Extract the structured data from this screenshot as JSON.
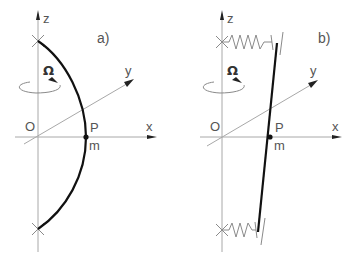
{
  "figure": {
    "panel_a": {
      "label": "a)",
      "axes": {
        "z": "z",
        "y": "y",
        "x": "x",
        "origin": "O"
      },
      "rotation_symbol": "Ω",
      "point_label": "P",
      "mass_label": "m",
      "description": "curved beam (arc) pinned at two points on z-axis, passing through point P on x-axis"
    },
    "panel_b": {
      "label": "b)",
      "axes": {
        "z": "z",
        "y": "y",
        "x": "x",
        "origin": "O"
      },
      "rotation_symbol": "Ω",
      "point_label": "P",
      "mass_label": "m",
      "description": "straight rigid bar supported by two springs attached to z-axis, passing through point P on x-axis"
    },
    "colors": {
      "axis": "#a8a8a8",
      "beam": "#111111",
      "text": "#555555"
    }
  }
}
